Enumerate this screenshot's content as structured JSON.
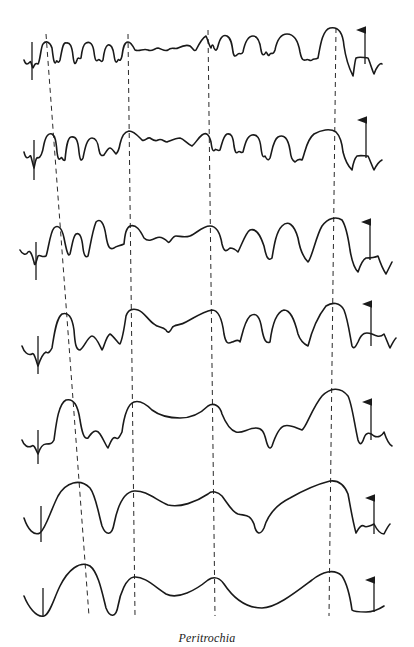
{
  "figure": {
    "caption": "Peritrochia",
    "trace_count": 7,
    "alignment_lines": 4,
    "stroke_color": "#1a1a1a",
    "background_color": "#ffffff"
  }
}
